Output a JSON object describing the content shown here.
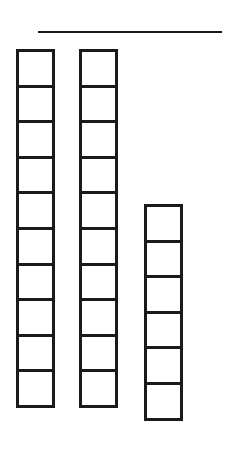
{
  "diagram": {
    "type": "place-value-blocks",
    "answer_line": {
      "visible": true,
      "value": ""
    },
    "columns": [
      {
        "name": "tens-rod-1",
        "cells": 10,
        "left": 16,
        "top": 49
      },
      {
        "name": "tens-rod-2",
        "cells": 10,
        "left": 79,
        "top": 49
      },
      {
        "name": "ones-stack",
        "cells": 6,
        "left": 144,
        "top": 204
      }
    ],
    "represented_value": 26,
    "colors": {
      "stroke": "#1a1a1a",
      "fill": "#ffffff",
      "background": "#ffffff"
    }
  }
}
